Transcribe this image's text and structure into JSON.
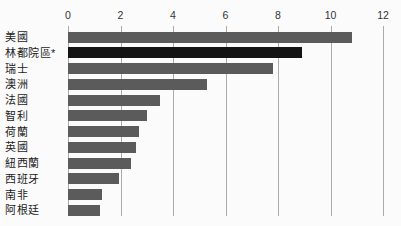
{
  "chart_data": {
    "type": "bar",
    "orientation": "horizontal",
    "title": "",
    "categories": [
      "美國",
      "林都院區*",
      "瑞士",
      "澳洲",
      "法國",
      "智利",
      "荷蘭",
      "英國",
      "紐西蘭",
      "西班牙",
      "南非",
      "阿根廷"
    ],
    "values": [
      10.8,
      8.9,
      7.8,
      5.3,
      3.5,
      3.0,
      2.7,
      2.6,
      2.4,
      1.95,
      1.3,
      1.2
    ],
    "highlight_index": 1,
    "highlight_category": "林都院區*",
    "xlim": [
      0,
      12
    ],
    "x_ticks": [
      0,
      2,
      4,
      6,
      8,
      10,
      12
    ],
    "grid": true,
    "legend_position": "none",
    "axis_position": "top",
    "colors": {
      "bar": "#5b5b5b",
      "highlight_bar": "#131313",
      "gridline": "#ababab",
      "background": "#fbfbfb",
      "category_text": "#1d1d1d",
      "tick_text": "#333333"
    }
  }
}
